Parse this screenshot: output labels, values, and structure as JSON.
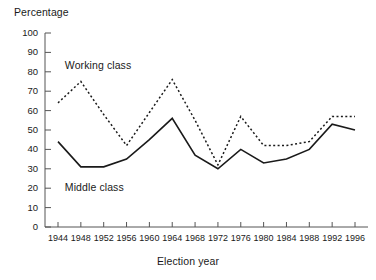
{
  "chart_data": {
    "type": "line",
    "title": "",
    "xlabel": "Election year",
    "ylabel": "Percentage",
    "ylim": [
      0,
      100
    ],
    "ytick_values": [
      0,
      10,
      20,
      30,
      40,
      50,
      60,
      70,
      80,
      90,
      100
    ],
    "grid": false,
    "legend_position": "inline-annotation",
    "categories": [
      "1944",
      "1948",
      "1952",
      "1956",
      "1960",
      "1964",
      "1968",
      "1972",
      "1976",
      "1980",
      "1984",
      "1988",
      "1992",
      "1996"
    ],
    "series": [
      {
        "name": "Working class",
        "style": "dashed",
        "color": "#1a1a1a",
        "values": [
          64,
          75,
          58,
          42,
          59,
          76,
          55,
          32,
          57,
          42,
          42,
          44,
          57,
          57
        ]
      },
      {
        "name": "Middle class",
        "style": "solid",
        "color": "#1a1a1a",
        "values": [
          44,
          31,
          31,
          35,
          45,
          56,
          37,
          30,
          40,
          33,
          35,
          40,
          53,
          50
        ]
      }
    ],
    "annotations": [
      {
        "text": "Working class",
        "x_year": "1948",
        "y_value": 83
      },
      {
        "text": "Middle class",
        "x_year": "1948",
        "y_value": 20
      }
    ]
  },
  "axis": {
    "y_title": "Percentage",
    "x_title": "Election year",
    "y_ticks": [
      "100",
      "90",
      "80",
      "70",
      "60",
      "50",
      "40",
      "30",
      "20",
      "10",
      "0"
    ],
    "x_ticks": [
      "1944",
      "1948",
      "1952",
      "1956",
      "1960",
      "1964",
      "1968",
      "1972",
      "1976",
      "1980",
      "1984",
      "1988",
      "1992",
      "1996"
    ]
  },
  "annotations": {
    "working_class": "Working class",
    "middle_class": "Middle class"
  },
  "colors": {
    "line": "#1a1a1a",
    "axis": "#555555",
    "background": "#ffffff"
  }
}
